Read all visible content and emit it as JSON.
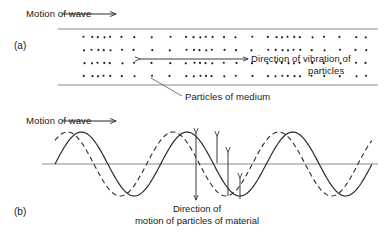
{
  "figure": {
    "width": 384,
    "height": 234,
    "background": "#ffffff",
    "ink": "#1a1a1a",
    "rail_color": "#8a8a8a"
  },
  "panel_a": {
    "tag": "(a)",
    "motion_label": "Motion of wave",
    "vibration_label_line1": "Direction of vibration of",
    "vibration_label_line2": "particles",
    "particles_label": "Particles of medium",
    "description": "longitudinal wave: rows of dots showing compressions and rarefactions between two horizontal rails",
    "rows": 4,
    "row_y": [
      37,
      50,
      63,
      76
    ],
    "rail_top_y": 29,
    "rail_bottom_y": 85,
    "rail_x_start": 58,
    "rail_x_end": 378,
    "dot_columns": [
      84,
      92,
      98,
      104,
      110,
      122,
      134,
      152,
      170,
      186,
      194,
      200,
      206,
      212,
      224,
      236,
      252,
      268,
      276,
      282,
      288,
      294,
      300,
      312,
      324,
      340,
      356,
      366
    ],
    "motion_arrow": {
      "x1": 62,
      "y": 14,
      "x2": 116
    },
    "vibration_arrow": {
      "x1": 140,
      "y": 59,
      "x2": 248
    },
    "leader_line": {
      "x1": 151,
      "y1": 78,
      "x2": 182,
      "y2": 96
    }
  },
  "panel_b": {
    "tag": "(b)",
    "motion_label": "Motion of wave",
    "caption_line1": "Direction of",
    "caption_line2": "motion of particles of material",
    "description": "transverse wave: solid sine wave plus phase-shifted dashed sine wave with vertical particle-displacement arrows",
    "baseline_y": 164,
    "wave_x_start": 55,
    "wave_x_end": 372,
    "amplitude": 32,
    "cycles": 3,
    "solid_phase_offset": 0,
    "dashed_phase_offset": 14,
    "motion_arrow": {
      "x1": 62,
      "y": 121,
      "x2": 116
    },
    "arrows": [
      {
        "x": 196,
        "y_top": 133,
        "y_bottom": 200,
        "heads": "both"
      },
      {
        "x": 217,
        "y_top": 136,
        "y_bottom": 163,
        "heads": "up"
      },
      {
        "x": 228,
        "y_top": 152,
        "y_bottom": 196,
        "heads": "up"
      },
      {
        "x": 240,
        "y_top": 178,
        "y_bottom": 199,
        "heads": "up"
      }
    ]
  },
  "colors": {
    "curve": "#2b2b2b",
    "axis": "#8a8a8a",
    "arrow": "#3a3a3a"
  }
}
